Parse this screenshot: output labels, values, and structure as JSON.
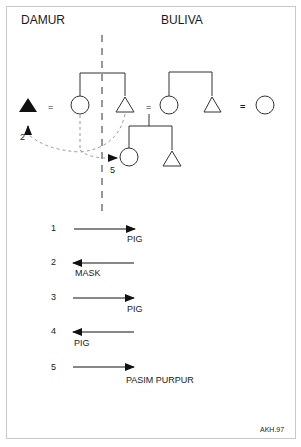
{
  "diagram": {
    "groups": {
      "left": "DAMUR",
      "right": "BULIVA"
    },
    "pedigree": {
      "marriage_signs": [
        "=",
        "=",
        "="
      ],
      "exchange_path_labels": [
        "2",
        "5"
      ]
    },
    "legend": [
      {
        "number": "1",
        "direction": "right",
        "item": "PIG"
      },
      {
        "number": "2",
        "direction": "left",
        "item": "MASK"
      },
      {
        "number": "3",
        "direction": "right",
        "item": "PIG"
      },
      {
        "number": "4",
        "direction": "left",
        "item": "PIG"
      },
      {
        "number": "5",
        "direction": "right",
        "item": "PASIM PURPUR"
      }
    ],
    "credit": "AKH.97"
  }
}
